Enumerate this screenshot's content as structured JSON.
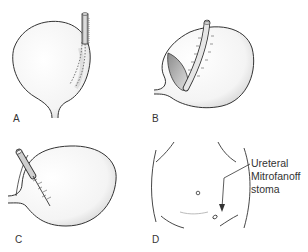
{
  "figure": {
    "panels": [
      {
        "label": "A",
        "description": "Bladder with tube tunneled along outer wall (dotted submucosal tunnel)"
      },
      {
        "label": "B",
        "description": "Bladder opened with flap; tube sutured along incision"
      },
      {
        "label": "C",
        "description": "Bladder with tube entering and sutured tunnel"
      },
      {
        "label": "D",
        "description": "Abdominal wall showing stomas"
      }
    ],
    "annotation": {
      "lines": [
        "Ureteral",
        "Mitrofanoff",
        "stoma"
      ]
    },
    "colors": {
      "line": "#333333",
      "shade": "#c8c8c8",
      "tube": "#bdbdbd"
    }
  }
}
